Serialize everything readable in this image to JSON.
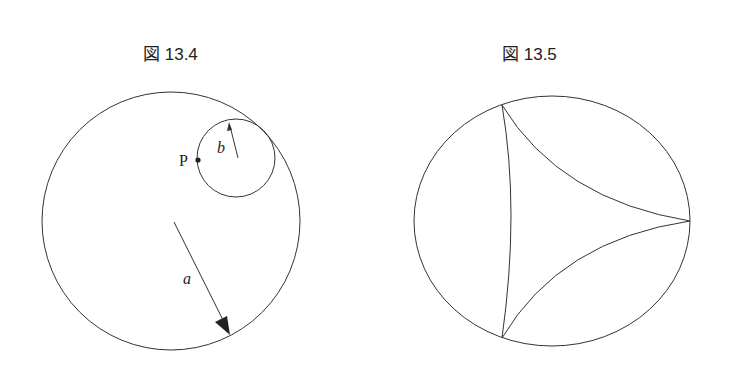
{
  "figures": [
    {
      "caption": "図 13.4",
      "labels": {
        "point": "P",
        "small_radius": "b",
        "large_radius": "a"
      },
      "description": "Large circle of radius a with small rolling circle of radius b inside, point P on small circle"
    },
    {
      "caption": "図 13.5",
      "description": "Circle with inscribed deltoid (three-cusped hypocycloid)"
    }
  ],
  "colors": {
    "stroke": "#333333",
    "text": "#222222",
    "background": "#ffffff"
  }
}
